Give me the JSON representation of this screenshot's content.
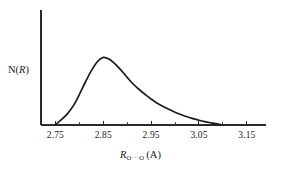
{
  "figure": {
    "background_color": "#ffffff",
    "ink_color": "#1c1c1c"
  },
  "y_axis": {
    "label_prefix": "N(",
    "label_variable": "R",
    "label_suffix": ")",
    "label_full": "N(R)"
  },
  "x_axis": {
    "label_variable": "R",
    "label_subscript": "O···O",
    "label_unit": "(A)",
    "label_full": "R O···O (A)"
  },
  "ticks": {
    "major_labels": [
      "2.75",
      "2.85",
      "2.95",
      "3.05",
      "3.15"
    ],
    "major_values": [
      2.75,
      2.85,
      2.95,
      3.05,
      3.15
    ],
    "minor_count_between": 1
  },
  "chart_data": {
    "type": "line",
    "title": "",
    "subtitle": "",
    "xlabel": "R O···O (A)",
    "ylabel": "N(R)",
    "xlim": [
      2.72,
      3.19
    ],
    "ylim": [
      0,
      1.08
    ],
    "grid": false,
    "legend": null,
    "xticks": [
      2.75,
      2.85,
      2.95,
      3.05,
      3.15
    ],
    "xticklabels": [
      "2.75",
      "2.85",
      "2.95",
      "3.05",
      "3.15"
    ],
    "yticks": [],
    "yticklabels": [],
    "annotations": [],
    "series": [
      {
        "name": "N(R)",
        "color": "#1c1c1c",
        "x": [
          2.75,
          2.762,
          2.775,
          2.788,
          2.8,
          2.812,
          2.825,
          2.838,
          2.85,
          2.862,
          2.875,
          2.888,
          2.9,
          2.912,
          2.925,
          2.938,
          2.95,
          2.962,
          2.975,
          2.988,
          3.0,
          3.012,
          3.025,
          3.038,
          3.05,
          3.062,
          3.075,
          3.088,
          3.1
        ],
        "y": [
          0.0,
          0.075,
          0.165,
          0.29,
          0.45,
          0.625,
          0.8,
          0.94,
          1.0,
          0.975,
          0.9,
          0.805,
          0.705,
          0.61,
          0.525,
          0.45,
          0.385,
          0.325,
          0.275,
          0.23,
          0.19,
          0.155,
          0.122,
          0.094,
          0.07,
          0.05,
          0.032,
          0.016,
          0.0
        ]
      }
    ]
  }
}
